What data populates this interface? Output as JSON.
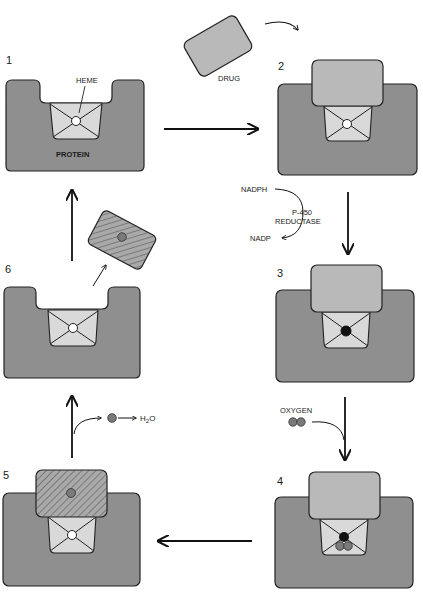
{
  "colors": {
    "protein": "#8f8f8f",
    "drug": "#b9b9b9",
    "heme": "#d9d9d9",
    "iron_reduced": "#111111",
    "oxygen_atom": "#7a7a7a",
    "outline": "#222222"
  },
  "stages": [
    {
      "number": "1",
      "labels": {
        "heme": "HEME",
        "protein": "PROTEIN"
      },
      "iron": "open",
      "drug": "none"
    },
    {
      "number": "2",
      "iron": "open",
      "drug": "bound"
    },
    {
      "number": "3",
      "iron": "reduced",
      "drug": "bound"
    },
    {
      "number": "4",
      "iron": "reduced",
      "drug": "bound",
      "oxygen": "bound"
    },
    {
      "number": "5",
      "iron": "open",
      "drug": "hydroxylated"
    },
    {
      "number": "6",
      "iron": "open",
      "drug": "released"
    }
  ],
  "labels": {
    "drug": "DRUG",
    "nadph": "NADPH",
    "reductase_line1": "P-450",
    "reductase_line2": "REDUCTASE",
    "nadp": "NADP",
    "oxygen": "OXYGEN",
    "water_h": "H",
    "water_2": "2",
    "water_o": "O"
  }
}
